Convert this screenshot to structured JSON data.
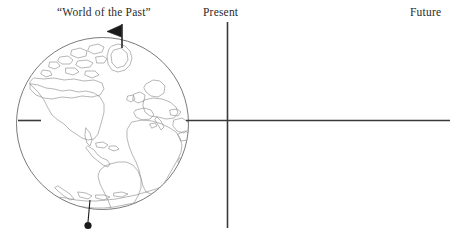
{
  "figure": {
    "width": 467,
    "height": 234,
    "background": "#ffffff"
  },
  "labels": {
    "past": "“World of the Past”",
    "present": "Present",
    "future": "Future"
  },
  "colors": {
    "text": "#2b2b2b",
    "axis": "#3a3a3a",
    "globe_outline": "#6b6b6b",
    "coastline": "#8a8a8a",
    "marker_fill": "#1a1a1a"
  },
  "axes": {
    "horizontal": {
      "y": 120,
      "left_stub": {
        "x1": 18,
        "x2": 41
      },
      "right_segment": {
        "x1": 186,
        "x2": 450
      }
    },
    "vertical": {
      "x": 227,
      "y1": 22,
      "y2": 228
    },
    "origin": {
      "x": 227,
      "y": 120
    }
  },
  "globe": {
    "center_x": 102.5,
    "center_y": 123.5,
    "radius_x": 86,
    "radius_y": 86,
    "projection": "Atlantic-centered orthographic",
    "regions": [
      "North America",
      "Greenland",
      "Canadian Arctic Archipelago",
      "South America",
      "Europe",
      "Africa",
      "Mediterranean Sea",
      "Arabian Peninsula",
      "Antarctica",
      "Antarctic Peninsula"
    ]
  },
  "markers": {
    "north_pole_flag": {
      "pole_x": 122,
      "pole_top_y": 24,
      "pole_bottom_y": 48,
      "flag_direction": "left",
      "flag_width": 14,
      "flag_height": 11
    },
    "south_pole_pin": {
      "line_x1": 90,
      "line_y1": 200,
      "line_x2": 88,
      "line_y2": 223,
      "dot_x": 88,
      "dot_y": 225,
      "dot_radius": 3.6
    }
  }
}
